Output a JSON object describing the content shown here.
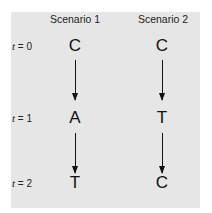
{
  "headers": [
    "Scenario 1",
    "Scenario 2"
  ],
  "time_labels": [
    {
      "var": "t",
      "text": " = 0"
    },
    {
      "var": "t",
      "text": " = 1"
    },
    {
      "var": "t",
      "text": " = 2"
    }
  ],
  "scenario1": [
    "C",
    "A",
    "T"
  ],
  "scenario2": [
    "C",
    "T",
    "C"
  ],
  "colors": {
    "panel": "#e6e6e6",
    "ink": "#111111"
  }
}
